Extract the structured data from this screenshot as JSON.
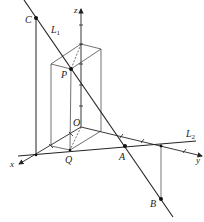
{
  "figure": {
    "type": "3d-coordinate-diagram",
    "axes": {
      "x": {
        "label": "x"
      },
      "y": {
        "label": "y"
      },
      "z": {
        "label": "z"
      },
      "origin": {
        "label": "O"
      }
    },
    "lines": [
      {
        "name": "L1",
        "label": "L",
        "subscript": "1"
      },
      {
        "name": "L2",
        "label": "L",
        "subscript": "2"
      }
    ],
    "points": [
      {
        "name": "C",
        "label": "C"
      },
      {
        "name": "P",
        "label": "P"
      },
      {
        "name": "Q",
        "label": "Q"
      },
      {
        "name": "A",
        "label": "A"
      },
      {
        "name": "B",
        "label": "B"
      }
    ],
    "colors": {
      "ink": "#222222",
      "thin": "#555555",
      "background": "#ffffff"
    }
  }
}
